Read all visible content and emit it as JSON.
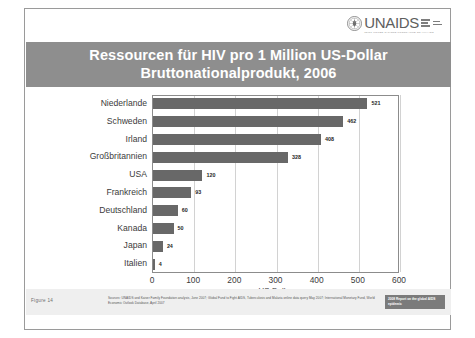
{
  "logo": {
    "emblem_name": "who-emblem-icon",
    "wordmark": "UNAIDS",
    "tagline": "JOINT UNITED NATIONS PROGRAMME ON HIV/AIDS"
  },
  "title": {
    "line1": "Ressourcen für HIV pro 1 Million US-Dollar",
    "line2": "Bruttonationalprodukt, 2006"
  },
  "footer": {
    "figure_label": "Figure  14",
    "source": "Sources: UNAIDS and Kaiser Family Foundation analysis, June 2007; Global Fund to Fight AIDS, Tuberculosis and Malaria online data query May 2007; International Monetary Fund, World Economic Outlook Database, April 2007",
    "badge": "2008 Report on the global AIDS epidemic"
  },
  "colors": {
    "title_band": "#8e8e8e",
    "bar": "#686868",
    "grid": "#d2d2d2",
    "axis": "#8c8c8c",
    "footer_band": "#efefef",
    "badge": "#7b7b7b"
  },
  "chart_data": {
    "type": "bar",
    "orientation": "horizontal",
    "title": "Ressourcen für HIV pro 1 Million US-Dollar Bruttonationalprodukt, 2006",
    "xlabel": "US-Dollar",
    "ylabel": "",
    "xlim": [
      0,
      600
    ],
    "xticks": [
      0,
      100,
      200,
      300,
      400,
      500,
      600
    ],
    "grid": "vertical",
    "legend": "none",
    "data_labels": true,
    "categories": [
      "Niederlande",
      "Schweden",
      "Irland",
      "Großbritannien",
      "USA",
      "Frankreich",
      "Deutschland",
      "Kanada",
      "Japan",
      "Italien"
    ],
    "values": [
      521,
      462,
      408,
      328,
      120,
      93,
      60,
      50,
      24,
      4
    ]
  }
}
